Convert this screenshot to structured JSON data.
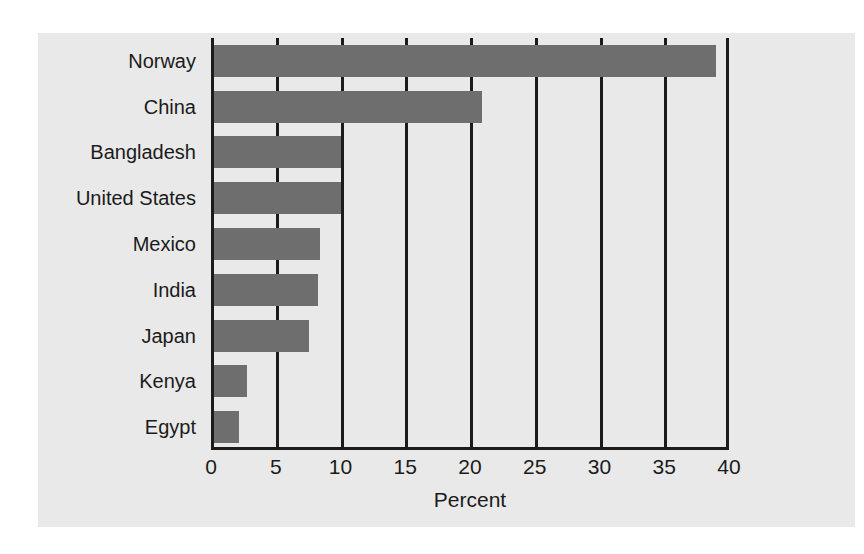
{
  "chart_data": {
    "type": "bar",
    "orientation": "horizontal",
    "title": "",
    "subtitle": "",
    "xlabel": "Percent",
    "ylabel": "",
    "categories": [
      "Norway",
      "China",
      "Bangladesh",
      "United States",
      "Mexico",
      "India",
      "Japan",
      "Kenya",
      "Egypt"
    ],
    "values": [
      39,
      20.9,
      10,
      10,
      8.4,
      8.3,
      7.6,
      2.8,
      2.2
    ],
    "xlim": [
      0,
      40
    ],
    "xticks": [
      0,
      5,
      10,
      15,
      20,
      25,
      30,
      35,
      40
    ],
    "xtick_labels": [
      "0",
      "5",
      "10",
      "15",
      "20",
      "25",
      "30",
      "35",
      "40"
    ],
    "grid": true,
    "grid_axis": "x",
    "legend": null,
    "legend_position": "none",
    "annotations": []
  },
  "style": {
    "panel_background": "#e9e9e9",
    "figure_background": "#ffffff",
    "bar_color": "#6e6e6e",
    "axis_color": "#1b1b1b",
    "grid_color": "#1b1b1b",
    "text_color": "#1b1b1b"
  }
}
